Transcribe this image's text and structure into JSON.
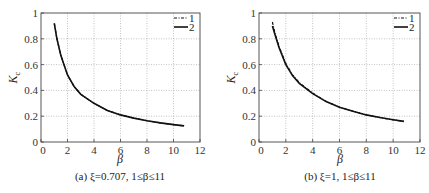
{
  "chart_data": [
    {
      "type": "line",
      "panel": "a",
      "caption": "(a) ξ=0.707, 1≤β≤11",
      "xlabel": "β",
      "ylabel": "Kc",
      "xlim": [
        0,
        12
      ],
      "ylim": [
        0,
        1
      ],
      "xticks": [
        0,
        2,
        4,
        6,
        8,
        10,
        12
      ],
      "yticks": [
        0,
        0.2,
        0.4,
        0.6,
        0.8,
        1
      ],
      "grid": true,
      "legend_position": "upper right",
      "series": [
        {
          "name": "1",
          "style": "dash-dot",
          "x": [
            1.0,
            1.2,
            1.5,
            2,
            2.5,
            3,
            4,
            5,
            6,
            7,
            8,
            9,
            10,
            10.8
          ],
          "y": [
            0.92,
            0.8,
            0.67,
            0.52,
            0.43,
            0.37,
            0.3,
            0.245,
            0.21,
            0.185,
            0.165,
            0.148,
            0.135,
            0.125
          ]
        },
        {
          "name": "2",
          "style": "solid",
          "x": [
            1.0,
            1.2,
            1.5,
            2,
            2.5,
            3,
            4,
            5,
            6,
            7,
            8,
            9,
            10,
            10.8
          ],
          "y": [
            0.92,
            0.8,
            0.67,
            0.52,
            0.43,
            0.37,
            0.3,
            0.245,
            0.21,
            0.185,
            0.165,
            0.148,
            0.135,
            0.125
          ]
        }
      ]
    },
    {
      "type": "line",
      "panel": "b",
      "caption": "(b) ξ=1, 1≤β≤11",
      "xlabel": "β",
      "ylabel": "Kc",
      "xlim": [
        0,
        12
      ],
      "ylim": [
        0,
        1
      ],
      "xticks": [
        0,
        2,
        4,
        6,
        8,
        10,
        12
      ],
      "yticks": [
        0,
        0.2,
        0.4,
        0.6,
        0.8,
        1
      ],
      "grid": true,
      "legend_position": "upper right",
      "series": [
        {
          "name": "1",
          "style": "dash-dot",
          "x": [
            1.0,
            1.2,
            1.5,
            2,
            2.5,
            3,
            4,
            5,
            6,
            7,
            8,
            9,
            10,
            10.8
          ],
          "y": [
            0.93,
            0.84,
            0.74,
            0.61,
            0.52,
            0.46,
            0.38,
            0.315,
            0.27,
            0.24,
            0.21,
            0.19,
            0.172,
            0.16
          ]
        },
        {
          "name": "2",
          "style": "solid",
          "x": [
            1.0,
            1.2,
            1.5,
            2,
            2.5,
            3,
            4,
            5,
            6,
            7,
            8,
            9,
            10,
            10.8
          ],
          "y": [
            0.9,
            0.83,
            0.73,
            0.6,
            0.515,
            0.455,
            0.375,
            0.313,
            0.27,
            0.238,
            0.21,
            0.19,
            0.172,
            0.16
          ]
        }
      ]
    }
  ],
  "labels": {
    "panel_a": {
      "caption": "(a) ξ=0.707, 1≤β≤11",
      "xlabel": "β",
      "ylabel_main": "K",
      "ylabel_sub": "c",
      "legend": [
        "1",
        "2"
      ]
    },
    "panel_b": {
      "caption": "(b) ξ=1, 1≤β≤11",
      "xlabel": "β",
      "ylabel_main": "K",
      "ylabel_sub": "c",
      "legend": [
        "1",
        "2"
      ]
    }
  }
}
